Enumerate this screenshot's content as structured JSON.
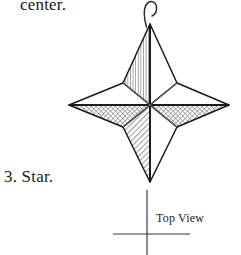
{
  "page": {
    "background_color": "#ffffff",
    "ink_color": "#1a1a1a",
    "width": 241,
    "height": 255
  },
  "captions": {
    "continuation_text": "center.",
    "item_number_and_name": "3.  Star.",
    "projection_label": "Top View"
  },
  "figure": {
    "name": "four-pointed-star-ornament",
    "line_color": "#1a1a1a",
    "hatch_color": "#4a4a4a",
    "star": {
      "center": {
        "x": 150,
        "y": 105
      },
      "tips": {
        "top": {
          "x": 150,
          "y": 24
        },
        "right": {
          "x": 229,
          "y": 105
        },
        "bottom": {
          "x": 150,
          "y": 182
        },
        "left": {
          "x": 69,
          "y": 105
        }
      },
      "inner_vertices": {
        "top_left": {
          "x": 123,
          "y": 83
        },
        "top_right": {
          "x": 177,
          "y": 83
        },
        "bottom_right": {
          "x": 177,
          "y": 127
        },
        "bottom_left": {
          "x": 123,
          "y": 127
        }
      }
    },
    "hook": {
      "name": "hanging-hook",
      "attach": {
        "x": 147,
        "y": 25
      },
      "top": {
        "x": 150,
        "y": 2
      }
    }
  },
  "crosshair": {
    "name": "top-view-axis-crosshair",
    "vertical": {
      "x": 147,
      "y1": 190,
      "y2": 255
    },
    "horizontal": {
      "y": 234,
      "x1": 113,
      "x2": 190
    },
    "color": "#3a3a3a"
  }
}
